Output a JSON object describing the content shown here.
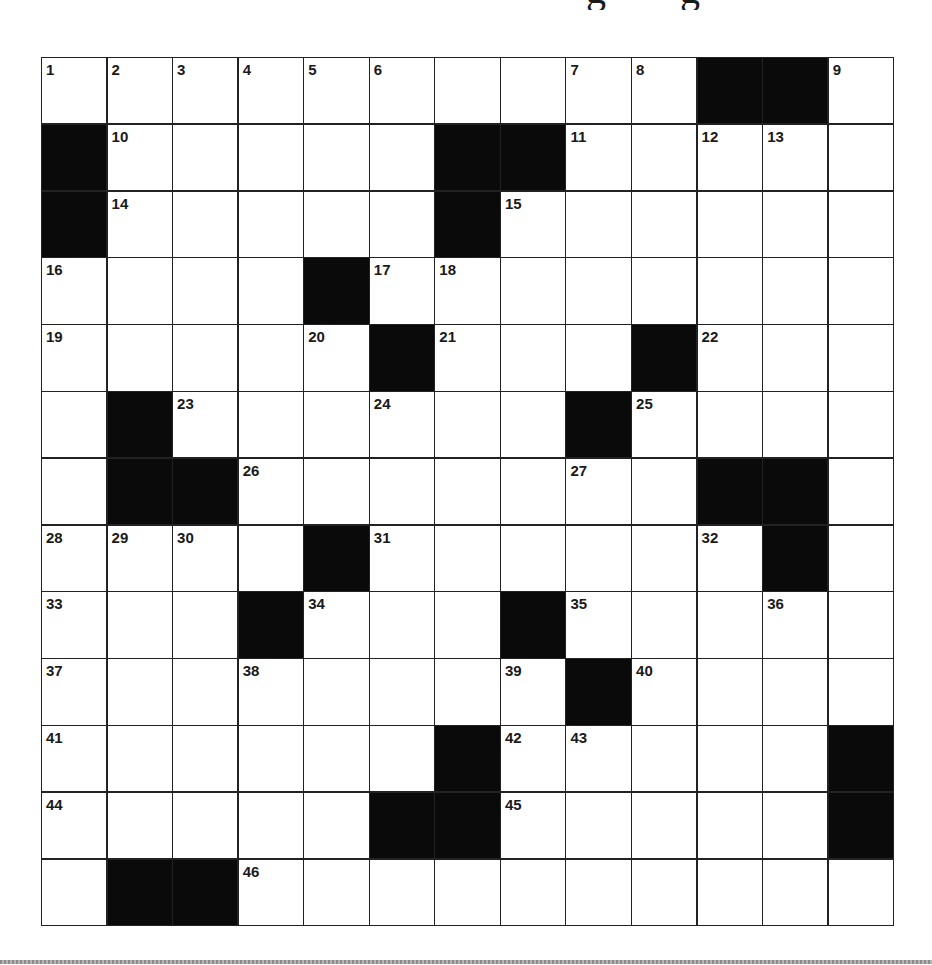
{
  "title_fragment": {
    "glyphs": [
      {
        "char": "g",
        "x": 586
      },
      {
        "char": "g",
        "x": 680
      }
    ]
  },
  "grid": {
    "rows": 13,
    "cols": 13,
    "cells": [
      [
        "1",
        "2",
        "3",
        "4",
        "5",
        "6",
        ".",
        ".",
        "7",
        "8",
        "#",
        "#",
        "9"
      ],
      [
        "#",
        "10",
        ".",
        ".",
        ".",
        ".",
        "#",
        "#",
        "11",
        ".",
        "12",
        "13",
        "."
      ],
      [
        "#",
        "14",
        ".",
        ".",
        ".",
        ".",
        "#",
        "15",
        ".",
        ".",
        ".",
        ".",
        "."
      ],
      [
        "16",
        ".",
        ".",
        ".",
        "#",
        "17",
        "18",
        ".",
        ".",
        ".",
        ".",
        ".",
        "."
      ],
      [
        "19",
        ".",
        ".",
        ".",
        "20",
        "#",
        "21",
        ".",
        ".",
        "#",
        "22",
        ".",
        "."
      ],
      [
        ".",
        "#",
        "23",
        ".",
        ".",
        "24",
        ".",
        ".",
        "#",
        "25",
        ".",
        ".",
        "."
      ],
      [
        ".",
        "#",
        "#",
        "26",
        ".",
        ".",
        ".",
        ".",
        "27",
        ".",
        "#",
        "#",
        "."
      ],
      [
        "28",
        "29",
        "30",
        ".",
        "#",
        "31",
        ".",
        ".",
        ".",
        ".",
        "32",
        "#",
        "."
      ],
      [
        "33",
        ".",
        ".",
        "#",
        "34",
        ".",
        ".",
        "#",
        "35",
        ".",
        ".",
        "36",
        "."
      ],
      [
        "37",
        ".",
        ".",
        "38",
        ".",
        ".",
        ".",
        "39",
        "#",
        "40",
        ".",
        ".",
        "."
      ],
      [
        "41",
        ".",
        ".",
        ".",
        ".",
        ".",
        "#",
        "42",
        "43",
        ".",
        ".",
        ".",
        "#"
      ],
      [
        "44",
        ".",
        ".",
        ".",
        ".",
        "#",
        "#",
        "45",
        ".",
        ".",
        ".",
        ".",
        "#"
      ],
      [
        ".",
        "#",
        "#",
        "46",
        ".",
        ".",
        ".",
        ".",
        ".",
        ".",
        ".",
        ".",
        "."
      ]
    ],
    "legend": {
      "#": "black-square",
      ".": "empty-white-square",
      "number": "numbered-white-square"
    }
  },
  "colors": {
    "black_square": "#0a0a0a",
    "grid_line": "#222222",
    "white_square": "#ffffff",
    "number_text": "#1a1a1a"
  }
}
